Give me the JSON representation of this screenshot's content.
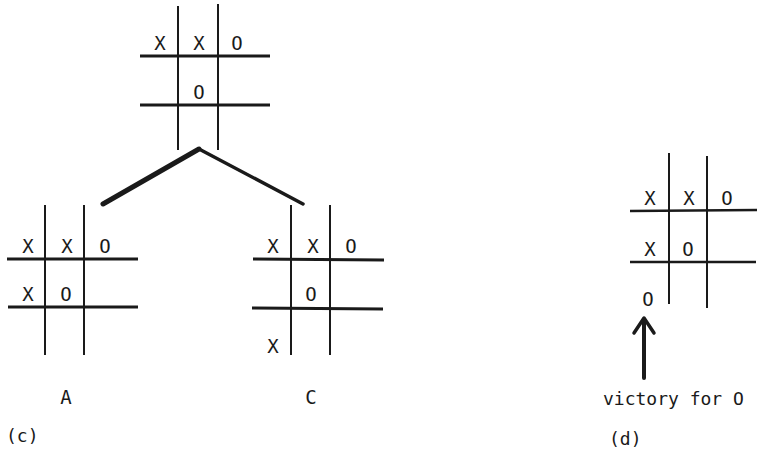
{
  "figure": {
    "stroke_color": "#1a1a1a",
    "background": "#ffffff"
  },
  "panel_c": {
    "caption": "(c)",
    "root_board": {
      "cells": [
        [
          "X",
          "X",
          "O"
        ],
        [
          "",
          "O",
          ""
        ],
        [
          "",
          "",
          ""
        ]
      ]
    },
    "children": [
      {
        "label": "A",
        "cells": [
          [
            "X",
            "X",
            "O"
          ],
          [
            "X",
            "O",
            ""
          ],
          [
            "",
            "",
            ""
          ]
        ]
      },
      {
        "label": "C",
        "cells": [
          [
            "X",
            "X",
            "O"
          ],
          [
            "",
            "O",
            ""
          ],
          [
            "X",
            "",
            ""
          ]
        ]
      }
    ]
  },
  "panel_d": {
    "caption": "(d)",
    "board": {
      "cells": [
        [
          "X",
          "X",
          "O"
        ],
        [
          "X",
          "O",
          ""
        ],
        [
          "O",
          "",
          ""
        ]
      ]
    },
    "arrow_label": "victory for O"
  }
}
